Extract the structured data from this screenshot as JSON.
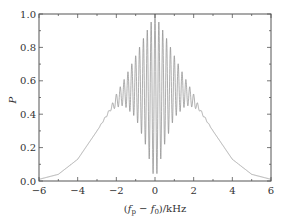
{
  "chart_data": {
    "type": "line",
    "title": "",
    "xlabel": "(f_p - f_0)/kHz",
    "xlabel_parts": {
      "open": "(",
      "f1": "f",
      "sub1": "p",
      "minus": " − ",
      "f2": "f",
      "sub2": "0",
      "close": ")/kHz"
    },
    "ylabel": "P",
    "xlim": [
      -6,
      6
    ],
    "ylim": [
      0,
      1.0
    ],
    "xticks": [
      -6,
      -4,
      -2,
      0,
      2,
      4,
      6
    ],
    "xtick_labels": [
      "−6",
      "−4",
      "−2",
      "0",
      "2",
      "4",
      "6"
    ],
    "yticks": [
      0.0,
      0.2,
      0.4,
      0.6,
      0.8,
      1.0
    ],
    "ytick_labels": [
      "0.0",
      "0.2",
      "0.4",
      "0.6",
      "0.8",
      "1.0"
    ],
    "grid": false,
    "legend": null,
    "series": [
      {
        "name": "P (rapidly oscillating)",
        "color": "#888888",
        "description": "Symmetric spectrum: smooth Gaussian-like wings, dense oscillation in |x| < ~2.3 kHz; upper envelope peaks at 1.0 at x=0, lower envelope dips to ~0 at x=0",
        "upper_envelope": {
          "x": [
            -6,
            -5,
            -4,
            -3,
            -2.3,
            -2,
            -1.5,
            -1,
            -0.5,
            0,
            0.5,
            1,
            1.5,
            2,
            2.3,
            3,
            4,
            5,
            6
          ],
          "y": [
            0.01,
            0.04,
            0.13,
            0.3,
            0.44,
            0.52,
            0.63,
            0.75,
            0.88,
            1.0,
            0.88,
            0.75,
            0.63,
            0.52,
            0.44,
            0.3,
            0.13,
            0.04,
            0.01
          ]
        },
        "lower_envelope": {
          "x": [
            -6,
            -5,
            -4,
            -3,
            -2.3,
            -2,
            -1.7,
            -1.5,
            -1,
            -0.5,
            0,
            0.5,
            1,
            1.5,
            1.7,
            2,
            2.3,
            3,
            4,
            5,
            6
          ],
          "y": [
            0.01,
            0.04,
            0.13,
            0.3,
            0.42,
            0.44,
            0.45,
            0.44,
            0.38,
            0.22,
            0.0,
            0.22,
            0.38,
            0.44,
            0.45,
            0.44,
            0.42,
            0.3,
            0.13,
            0.04,
            0.01
          ]
        },
        "oscillation_period_khz": 0.2
      }
    ]
  },
  "style": {
    "frame_color": "#555555",
    "line_color": "#8a8a8a"
  }
}
